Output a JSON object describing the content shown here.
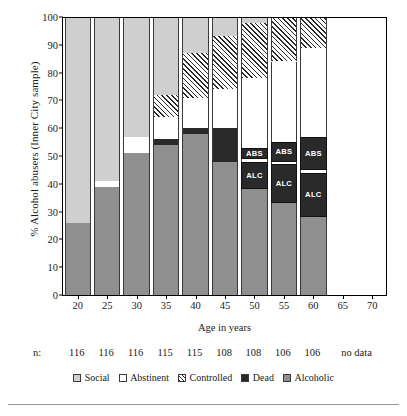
{
  "chart_data": {
    "type": "bar",
    "subtype": "stacked-bar-100",
    "title": "",
    "xlabel": "Age in years",
    "ylabel": "% Alcohol abusers (Inner City sample)",
    "ylim": [
      0,
      100
    ],
    "ytick_labels": [
      "0",
      "10",
      "20",
      "30",
      "40",
      "50",
      "60",
      "70",
      "80",
      "90",
      "100"
    ],
    "ytick_values": [
      0,
      10,
      20,
      30,
      40,
      50,
      60,
      70,
      80,
      90,
      100
    ],
    "xtick_labels": [
      "20",
      "25",
      "30",
      "35",
      "40",
      "45",
      "50",
      "55",
      "60",
      "65",
      "70"
    ],
    "categories": [
      20,
      25,
      30,
      35,
      40,
      45,
      50,
      55,
      60,
      65,
      70
    ],
    "grid": false,
    "legend_position": "bottom",
    "series": [
      {
        "name": "Social",
        "color": "#cfcfcf",
        "pattern": "solid",
        "values": [
          74,
          59,
          43,
          28,
          15,
          7,
          0,
          0,
          0,
          null,
          null
        ]
      },
      {
        "name": "Abstinent",
        "color": "#ffffff",
        "pattern": "solid",
        "values": [
          0,
          2,
          6,
          8,
          14,
          15,
          27,
          30,
          32,
          null,
          null
        ]
      },
      {
        "name": "Controlled",
        "color": "#ffffff",
        "pattern": "hatch",
        "values": [
          0,
          0,
          0,
          8,
          12,
          22,
          20,
          16,
          11,
          null,
          null
        ]
      },
      {
        "name": "Dead",
        "color": "#2a2a2a",
        "pattern": "solid",
        "values": [
          0,
          0,
          0,
          2,
          2,
          12,
          14,
          21,
          29,
          null,
          null
        ]
      },
      {
        "name": "Alcoholic",
        "color": "#8f8f8f",
        "pattern": "solid",
        "values": [
          26,
          39,
          51,
          54,
          57,
          44,
          39,
          33,
          28,
          null,
          null
        ]
      }
    ],
    "bars": [
      {
        "age": 20,
        "n": "116",
        "segments": [
          {
            "series": "Alcoholic",
            "from": 0,
            "to": 26
          },
          {
            "series": "Social",
            "from": 26,
            "to": 100
          }
        ]
      },
      {
        "age": 25,
        "n": "116",
        "segments": [
          {
            "series": "Alcoholic",
            "from": 0,
            "to": 39
          },
          {
            "series": "Abstinent",
            "from": 39,
            "to": 41
          },
          {
            "series": "Social",
            "from": 41,
            "to": 100
          }
        ]
      },
      {
        "age": 30,
        "n": "116",
        "segments": [
          {
            "series": "Alcoholic",
            "from": 0,
            "to": 51
          },
          {
            "series": "Abstinent",
            "from": 51,
            "to": 57
          },
          {
            "series": "Social",
            "from": 57,
            "to": 100
          }
        ]
      },
      {
        "age": 35,
        "n": "115",
        "segments": [
          {
            "series": "Alcoholic",
            "from": 0,
            "to": 54
          },
          {
            "series": "Dead",
            "from": 54,
            "to": 56
          },
          {
            "series": "Abstinent",
            "from": 56,
            "to": 64
          },
          {
            "series": "Controlled",
            "from": 64,
            "to": 72
          },
          {
            "series": "Social",
            "from": 72,
            "to": 100
          }
        ]
      },
      {
        "age": 40,
        "n": "115",
        "segments": [
          {
            "series": "Alcoholic",
            "from": 0,
            "to": 58
          },
          {
            "series": "Dead",
            "from": 58,
            "to": 60
          },
          {
            "series": "Abstinent",
            "from": 60,
            "to": 71
          },
          {
            "series": "Controlled",
            "from": 71,
            "to": 87
          },
          {
            "series": "Social",
            "from": 87,
            "to": 100
          }
        ]
      },
      {
        "age": 45,
        "n": "108",
        "segments": [
          {
            "series": "Alcoholic",
            "from": 0,
            "to": 48
          },
          {
            "series": "Dead",
            "from": 48,
            "to": 60
          },
          {
            "series": "Abstinent",
            "from": 60,
            "to": 74
          },
          {
            "series": "Controlled",
            "from": 74,
            "to": 93
          },
          {
            "series": "Social",
            "from": 93,
            "to": 100
          }
        ]
      },
      {
        "age": 50,
        "n": "108",
        "segments": [
          {
            "series": "Alcoholic",
            "from": 0,
            "to": 38
          },
          {
            "series": "Dead",
            "from": 38,
            "to": 48,
            "label": "ALC"
          },
          {
            "series": "Abstinent",
            "from": 48,
            "to": 49
          },
          {
            "series": "Dead",
            "from": 49,
            "to": 53,
            "label": "ABS"
          },
          {
            "series": "Abstinent",
            "from": 53,
            "to": 78
          },
          {
            "series": "Controlled",
            "from": 78,
            "to": 98
          },
          {
            "series": "Social",
            "from": 98,
            "to": 100
          }
        ]
      },
      {
        "age": 55,
        "n": "106",
        "segments": [
          {
            "series": "Alcoholic",
            "from": 0,
            "to": 33
          },
          {
            "series": "Dead",
            "from": 33,
            "to": 47,
            "label": "ALC"
          },
          {
            "series": "Abstinent",
            "from": 47,
            "to": 48
          },
          {
            "series": "Dead",
            "from": 48,
            "to": 55,
            "label": "ABS"
          },
          {
            "series": "Abstinent",
            "from": 55,
            "to": 84
          },
          {
            "series": "Controlled",
            "from": 84,
            "to": 100
          }
        ]
      },
      {
        "age": 60,
        "n": "106",
        "segments": [
          {
            "series": "Alcoholic",
            "from": 0,
            "to": 28
          },
          {
            "series": "Dead",
            "from": 28,
            "to": 44,
            "label": "ALC"
          },
          {
            "series": "Abstinent",
            "from": 44,
            "to": 45
          },
          {
            "series": "Dead",
            "from": 45,
            "to": 57,
            "label": "ABS"
          },
          {
            "series": "Abstinent",
            "from": 57,
            "to": 89
          },
          {
            "series": "Controlled",
            "from": 89,
            "to": 100
          }
        ]
      },
      {
        "age": 65,
        "n": "no data",
        "segments": []
      },
      {
        "age": 70,
        "n": "no data",
        "segments": []
      }
    ],
    "n_row_label": "n:",
    "n_values": [
      "116",
      "116",
      "116",
      "115",
      "115",
      "108",
      "108",
      "106",
      "106"
    ],
    "no_data_text": "no data",
    "inline_labels": [
      "ABS",
      "ALC"
    ],
    "legend": [
      {
        "label": "Social",
        "swatch": "social"
      },
      {
        "label": "Abstinent",
        "swatch": "abstinent"
      },
      {
        "label": "Controlled",
        "swatch": "controlled"
      },
      {
        "label": "Dead",
        "swatch": "dead"
      },
      {
        "label": "Alcoholic",
        "swatch": "alcoholic"
      }
    ]
  }
}
